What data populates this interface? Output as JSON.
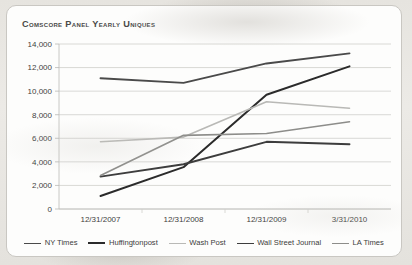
{
  "background_color": "#e8e6e1",
  "card": {
    "background_color": "#fdfdfc",
    "border_color": "#c9c7c2"
  },
  "chart_data": {
    "type": "line",
    "title": "Comscore Panel Yearly Uniques",
    "xlabel": "",
    "ylabel": "",
    "categories": [
      "12/31/2007",
      "12/31/2008",
      "12/31/2009",
      "3/31/2010"
    ],
    "ylim": [
      0,
      14000
    ],
    "ytick_step": 2000,
    "ytick_labels": [
      "0",
      "2,000",
      "4,000",
      "6,000",
      "8,000",
      "10,000",
      "12,000",
      "14,000"
    ],
    "ytick_values": [
      0,
      2000,
      4000,
      6000,
      8000,
      10000,
      12000,
      14000
    ],
    "grid": "horizontal",
    "legend_position": "bottom",
    "series": [
      {
        "name": "NY Times",
        "color": "#4a4a4a",
        "width": 1.9,
        "values": [
          11100,
          10700,
          12350,
          13200
        ]
      },
      {
        "name": "Huffingtonpost",
        "color": "#2b2b2b",
        "width": 2.0,
        "values": [
          1100,
          3550,
          9700,
          12100
        ]
      },
      {
        "name": "Wash Post",
        "color": "#b9b9b6",
        "width": 1.6,
        "values": [
          5700,
          6100,
          9100,
          8550
        ]
      },
      {
        "name": "Wall Street Journal",
        "color": "#3d3d3d",
        "width": 1.9,
        "values": [
          2750,
          3800,
          5700,
          5500
        ]
      },
      {
        "name": "LA Times",
        "color": "#8d8d8a",
        "width": 1.6,
        "values": [
          2850,
          6250,
          6400,
          7400
        ]
      }
    ]
  }
}
